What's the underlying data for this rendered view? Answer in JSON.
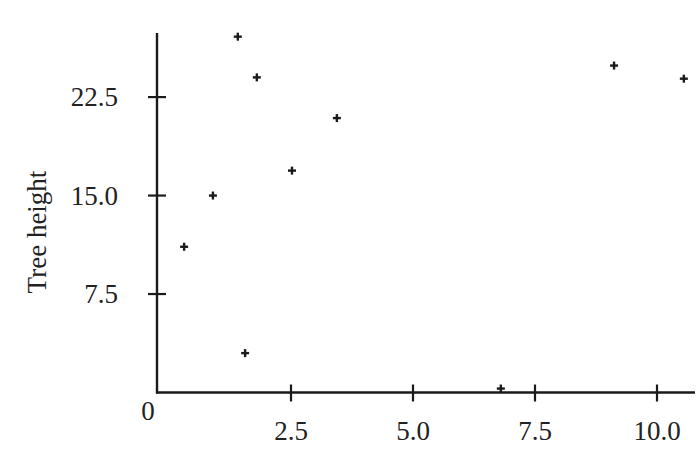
{
  "chart_data": {
    "type": "scatter",
    "title": "",
    "xlabel": "",
    "ylabel": "Tree height",
    "xlim": [
      0,
      10.75
    ],
    "ylim": [
      0,
      27.5
    ],
    "x_ticks": [
      2.5,
      5.0,
      7.5,
      10.0
    ],
    "x_tick_labels": [
      "2.5",
      "5.0",
      "7.5",
      "10.0"
    ],
    "y_ticks": [
      7.5,
      15.0,
      22.5
    ],
    "y_tick_labels": [
      "7.5",
      "15.0",
      "22.5"
    ],
    "origin_label": "0",
    "grid": false,
    "legend": null,
    "marker": "+",
    "series": [
      {
        "name": "Tree height",
        "points": [
          {
            "x": 0.31,
            "y": 11.1
          },
          {
            "x": 0.9,
            "y": 15.0
          },
          {
            "x": 1.41,
            "y": 27.1
          },
          {
            "x": 1.56,
            "y": 3.0
          },
          {
            "x": 1.8,
            "y": 24.0
          },
          {
            "x": 2.52,
            "y": 16.9
          },
          {
            "x": 3.44,
            "y": 20.9
          },
          {
            "x": 6.8,
            "y": 0.3
          },
          {
            "x": 9.12,
            "y": 24.9
          },
          {
            "x": 10.55,
            "y": 23.9
          }
        ]
      }
    ]
  },
  "colors": {
    "axis": "#1a1a1a",
    "marker": "#1a1a1a",
    "text": "#222222",
    "background": "#ffffff"
  }
}
